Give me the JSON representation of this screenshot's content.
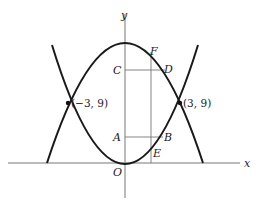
{
  "figure": {
    "axes": {
      "x_label": "x",
      "y_label": "y",
      "origin_label": "O"
    },
    "curves": [
      {
        "name": "upward-parabola",
        "equation": "y = x^2"
      },
      {
        "name": "downward-parabola",
        "equation": "y = 18 - x^2"
      }
    ],
    "intersections": [
      {
        "label": "(−3, 9)",
        "x": -3,
        "y": 9
      },
      {
        "label": "(3, 9)",
        "x": 3,
        "y": 9
      }
    ],
    "point_labels": {
      "A": "A",
      "B": "B",
      "C": "C",
      "D": "D",
      "E": "E",
      "F": "F"
    }
  }
}
